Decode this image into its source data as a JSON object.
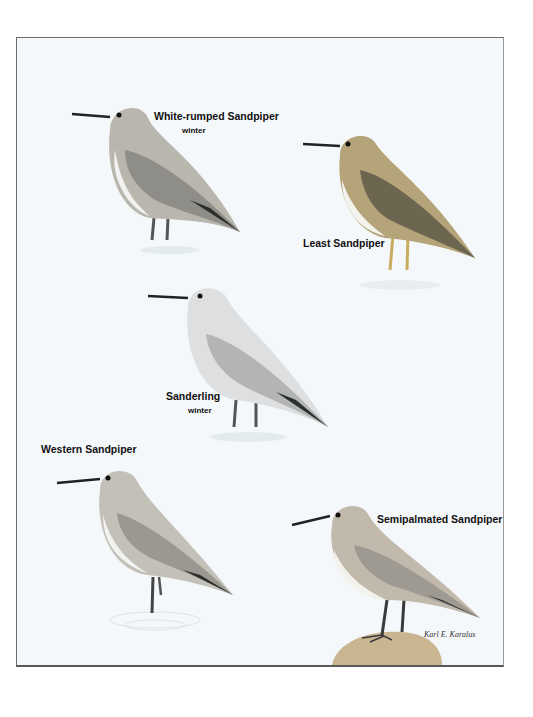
{
  "plate": {
    "birds": [
      {
        "name": "White-rumped Sandpiper",
        "season": "winter"
      },
      {
        "name": "Least Sandpiper",
        "season": ""
      },
      {
        "name": "Sanderling",
        "season": "winter"
      },
      {
        "name": "Western Sandpiper",
        "season": ""
      },
      {
        "name": "Semipalmated Sandpiper",
        "season": ""
      }
    ],
    "signature": "Karl E. Karalus"
  },
  "colors": {
    "background": "#f5f8fa",
    "frame": "#6a6a6a",
    "gray_plumage": "#9c9a94",
    "brown_plumage": "#8a7b5c",
    "primaries": "#2a2e2c",
    "rock": "#c9b690"
  }
}
